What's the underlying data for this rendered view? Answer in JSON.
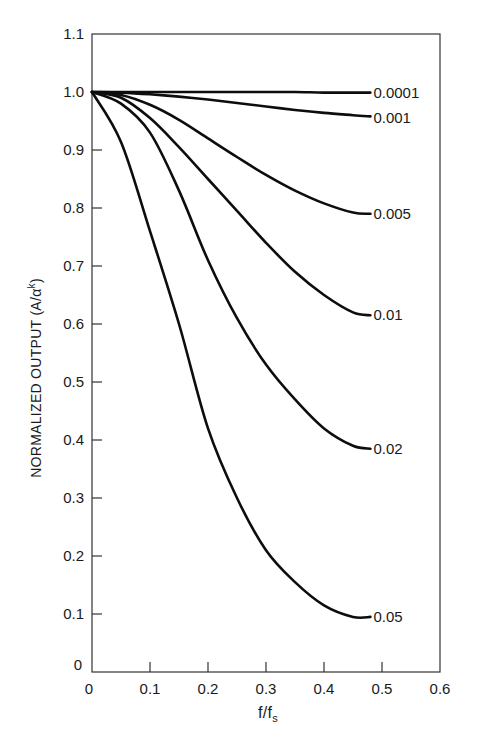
{
  "chart_data": {
    "type": "line",
    "title": "",
    "xlabel": "f/f",
    "xlabel_subscript": "s",
    "ylabel": "NORMALIZED OUTPUT (A/α",
    "ylabel_superscript": "k",
    "ylabel_close": ")",
    "xlim": [
      0,
      0.6
    ],
    "ylim": [
      0,
      1.1
    ],
    "grid": false,
    "frame": "box",
    "x_ticks": [
      0,
      0.1,
      0.2,
      0.3,
      0.4,
      0.5,
      0.6
    ],
    "x_tick_labels": [
      "0",
      "0.1",
      "0.2",
      "0.3",
      "0.4",
      "0.5",
      "0.6"
    ],
    "y_ticks": [
      0,
      0.1,
      0.2,
      0.3,
      0.4,
      0.5,
      0.6,
      0.7,
      0.8,
      0.9,
      1.0,
      1.1
    ],
    "y_tick_labels": [
      "0",
      "0.1",
      "0.2",
      "0.3",
      "0.4",
      "0.5",
      "0.6",
      "0.7",
      "0.8",
      "0.9",
      "1.0",
      "1.1"
    ],
    "legend_position": "inline labels at right end of each curve",
    "x": [
      0,
      0.05,
      0.1,
      0.15,
      0.2,
      0.25,
      0.3,
      0.35,
      0.4,
      0.45,
      0.48
    ],
    "series": [
      {
        "name": "0.0001",
        "values": [
          1.0,
          1.0,
          1.0,
          1.0,
          1.0,
          1.0,
          1.0,
          1.0,
          0.999,
          0.999,
          0.999
        ]
      },
      {
        "name": "0.001",
        "values": [
          1.0,
          0.999,
          0.996,
          0.992,
          0.987,
          0.981,
          0.975,
          0.969,
          0.964,
          0.96,
          0.958
        ]
      },
      {
        "name": "0.005",
        "values": [
          1.0,
          0.995,
          0.978,
          0.952,
          0.92,
          0.888,
          0.857,
          0.83,
          0.808,
          0.792,
          0.79
        ]
      },
      {
        "name": "0.01",
        "values": [
          1.0,
          0.99,
          0.955,
          0.905,
          0.85,
          0.795,
          0.74,
          0.69,
          0.65,
          0.62,
          0.615
        ]
      },
      {
        "name": "0.02",
        "values": [
          1.0,
          0.98,
          0.93,
          0.83,
          0.71,
          0.61,
          0.53,
          0.47,
          0.42,
          0.39,
          0.385
        ]
      },
      {
        "name": "0.05",
        "values": [
          1.0,
          0.914,
          0.76,
          0.6,
          0.42,
          0.3,
          0.21,
          0.155,
          0.115,
          0.095,
          0.095
        ]
      }
    ],
    "colors": {
      "line": "#0d0d0d",
      "axis": "#333333",
      "background": "#ffffff"
    }
  }
}
